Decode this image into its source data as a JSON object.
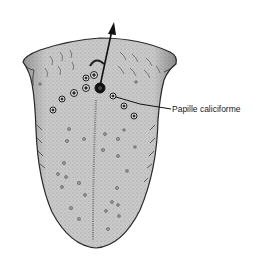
{
  "figure": {
    "labels": [
      {
        "text": "Papille caliciforme",
        "x": 172,
        "y": 112
      }
    ],
    "colors": {
      "tongue_fill": "#c9c9c9",
      "tongue_outline": "#2a2a2a",
      "papilla_dark": "#111111",
      "ink": "#1a1a1a"
    }
  }
}
